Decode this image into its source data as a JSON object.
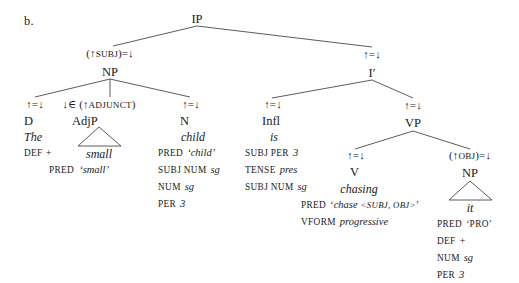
{
  "figure": {
    "panel_label": "b.",
    "caption_sentence": "The small child is chasing it",
    "line_color": "#4a4a4a",
    "text_color": "#1a1a1a",
    "background": "#ffffff"
  },
  "nodes": {
    "ip": {
      "category": "IP",
      "annotation": ""
    },
    "np_subj": {
      "category": "NP",
      "annotation_pre": "(↑",
      "annotation_sc": "SUBJ",
      "annotation_post": ")=↓"
    },
    "ibar": {
      "category": "I′",
      "annotation": "↑=↓"
    },
    "d": {
      "category": "D",
      "annotation": "↑=↓",
      "word": "The"
    },
    "adjp": {
      "category": "AdjP",
      "annotation_pre": "↓∈ (↑",
      "annotation_sc": "ADJUNCT",
      "annotation_post": ")",
      "word": "small"
    },
    "n": {
      "category": "N",
      "annotation": "↑=↓",
      "word": "child"
    },
    "infl": {
      "category": "Infl",
      "annotation": "↑=↓",
      "word": "is"
    },
    "vp": {
      "category": "VP",
      "annotation": "↑=↓"
    },
    "v": {
      "category": "V",
      "annotation": "↑=↓",
      "word": "chasing"
    },
    "np_obj": {
      "category": "NP",
      "annotation_pre": "(↑",
      "annotation_sc": "OBJ",
      "annotation_post": ")=↓",
      "word": "it"
    }
  },
  "features": {
    "d": [
      {
        "attr": "DEF",
        "value": "+"
      }
    ],
    "adjp": [
      {
        "attr": "PRED",
        "value": "‘small’"
      }
    ],
    "n": [
      {
        "attr": "PRED",
        "value": "‘child’"
      },
      {
        "attr": "SUBJ NUM",
        "value": "sg"
      },
      {
        "attr": "NUM",
        "value": "sg"
      },
      {
        "attr": "PER",
        "value": "3"
      }
    ],
    "infl": [
      {
        "attr": "SUBJ PER",
        "value": "3"
      },
      {
        "attr": "TENSE",
        "value": "pres"
      },
      {
        "attr": "SUBJ NUM",
        "value": "sg"
      }
    ],
    "v": [
      {
        "attr": "PRED",
        "value": "‘chase <SUBJ, OBJ>’"
      },
      {
        "attr": "VFORM",
        "value": "progressive"
      }
    ],
    "np_obj": [
      {
        "attr": "PRED",
        "value": "‘PRO’"
      },
      {
        "attr": "DEF",
        "value": "+"
      },
      {
        "attr": "NUM",
        "value": "sg"
      },
      {
        "attr": "PER",
        "value": "3"
      }
    ]
  },
  "feature_text": {
    "d_1_attr": "DEF",
    "d_1_val": "+",
    "adjp_1_attr": "PRED",
    "adjp_1_val": "‘small’",
    "n_1_attr": "PRED",
    "n_1_val": "‘child’",
    "n_2_attr": "SUBJ NUM",
    "n_2_val": "sg",
    "n_3_attr": "NUM",
    "n_3_val": "sg",
    "n_4_attr": "PER",
    "n_4_val": "3",
    "infl_1_attr": "SUBJ PER",
    "infl_1_val": "3",
    "infl_2_attr": "TENSE",
    "infl_2_val": "pres",
    "infl_3_attr": "SUBJ NUM",
    "infl_3_val": "sg",
    "v_1_attr": "PRED",
    "v_1_open": "‘",
    "v_1_pred": "chase",
    "v_1_args": "<SUBJ, OBJ>",
    "v_1_close": "’",
    "v_2_attr": "VFORM",
    "v_2_val": "progressive",
    "obj_1_attr": "PRED",
    "obj_1_val": "‘PRO’",
    "obj_2_attr": "DEF",
    "obj_2_val": "+",
    "obj_3_attr": "NUM",
    "obj_3_val": "sg",
    "obj_4_attr": "PER",
    "obj_4_val": "3"
  },
  "annotations": {
    "eq": "↑=↓",
    "subj_pre": "(↑",
    "subj_sc": "SUBJ",
    "subj_post": ")=↓",
    "adjunct_pre": "↓∈ (↑",
    "adjunct_sc": "ADJUNCT",
    "adjunct_post": ")",
    "obj_pre": "(↑",
    "obj_sc": "OBJ",
    "obj_post": ")=↓"
  },
  "words": {
    "the": "The",
    "small": "small",
    "child": "child",
    "is": "is",
    "chasing": "chasing",
    "it": "it"
  },
  "categories": {
    "ip": "IP",
    "np_subj": "NP",
    "ibar": "I′",
    "d": "D",
    "adjp": "AdjP",
    "n": "N",
    "infl": "Infl",
    "vp": "VP",
    "v": "V",
    "np_obj": "NP"
  }
}
